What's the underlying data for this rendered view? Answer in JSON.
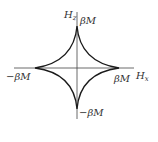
{
  "diagram": {
    "type": "astroid",
    "axes": {
      "x_label": "H",
      "x_sub": "x",
      "y_label": "H",
      "y_sub": "z"
    },
    "labels": {
      "top": "βM",
      "bottom": "−βM",
      "left": "−βM",
      "right": "βM"
    },
    "colors": {
      "curve": "#1a1a1a",
      "axis": "#333333",
      "text": "#333333"
    }
  }
}
